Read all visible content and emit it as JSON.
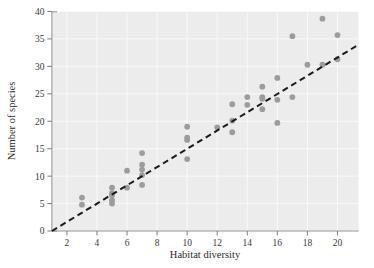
{
  "figure": {
    "title": "",
    "background_color": "#ffffff",
    "panel_color": "#ececec",
    "point_color": "#9c9c9c",
    "line_color": "#1a1a1a"
  },
  "axes": {
    "x_title": "Habitat diversity",
    "y_title": "Number of species",
    "x_ticks": [
      "2",
      "4",
      "6",
      "8",
      "10",
      "12",
      "14",
      "16",
      "18",
      "20"
    ],
    "y_ticks": [
      "0",
      "5",
      "10",
      "15",
      "20",
      "25",
      "30",
      "35",
      "40"
    ]
  },
  "chart_data": {
    "type": "scatter",
    "title": "",
    "xlabel": "Habitat diversity",
    "ylabel": "Number of species",
    "xlim": [
      1,
      21.4
    ],
    "ylim": [
      0,
      40
    ],
    "xticks": [
      2,
      4,
      6,
      8,
      10,
      12,
      14,
      16,
      18,
      20
    ],
    "yticks": [
      0,
      5,
      10,
      15,
      20,
      25,
      30,
      35,
      40
    ],
    "grid": true,
    "legend": null,
    "marker": "circle",
    "marker_color": "#9c9c9c",
    "points": [
      {
        "x": 3.0,
        "y": 6.1
      },
      {
        "x": 3.0,
        "y": 4.8
      },
      {
        "x": 5.0,
        "y": 7.9
      },
      {
        "x": 5.0,
        "y": 6.9
      },
      {
        "x": 5.0,
        "y": 6.5
      },
      {
        "x": 5.0,
        "y": 5.6
      },
      {
        "x": 5.0,
        "y": 5.0
      },
      {
        "x": 6.0,
        "y": 11.0
      },
      {
        "x": 6.0,
        "y": 7.9
      },
      {
        "x": 7.0,
        "y": 14.2
      },
      {
        "x": 7.0,
        "y": 12.1
      },
      {
        "x": 7.0,
        "y": 11.2
      },
      {
        "x": 7.0,
        "y": 10.2
      },
      {
        "x": 7.0,
        "y": 8.4
      },
      {
        "x": 10.0,
        "y": 19.0
      },
      {
        "x": 10.0,
        "y": 17.0
      },
      {
        "x": 10.0,
        "y": 16.6
      },
      {
        "x": 10.0,
        "y": 13.1
      },
      {
        "x": 12.0,
        "y": 18.9
      },
      {
        "x": 13.0,
        "y": 23.1
      },
      {
        "x": 13.0,
        "y": 20.1
      },
      {
        "x": 13.0,
        "y": 18.0
      },
      {
        "x": 14.0,
        "y": 24.4
      },
      {
        "x": 14.0,
        "y": 23.0
      },
      {
        "x": 15.0,
        "y": 26.3
      },
      {
        "x": 15.0,
        "y": 24.4
      },
      {
        "x": 15.0,
        "y": 24.1
      },
      {
        "x": 15.0,
        "y": 22.2
      },
      {
        "x": 16.0,
        "y": 27.9
      },
      {
        "x": 16.0,
        "y": 23.9
      },
      {
        "x": 16.0,
        "y": 19.7
      },
      {
        "x": 17.0,
        "y": 35.5
      },
      {
        "x": 17.0,
        "y": 24.4
      },
      {
        "x": 18.0,
        "y": 30.3
      },
      {
        "x": 19.0,
        "y": 38.7
      },
      {
        "x": 19.0,
        "y": 30.3
      },
      {
        "x": 20.0,
        "y": 35.7
      },
      {
        "x": 20.0,
        "y": 31.3
      }
    ],
    "fit_line": {
      "style": "dashed",
      "color": "#1a1a1a",
      "x_start": 1.0,
      "y_start": 0.0,
      "x_end": 21.25,
      "y_end": 33.7
    }
  }
}
